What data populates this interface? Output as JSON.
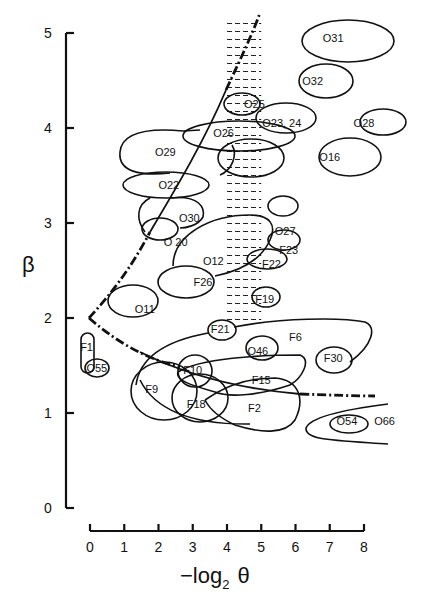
{
  "chart_data": {
    "type": "scatter",
    "title": "",
    "xlabel": "−log₂ θ",
    "ylabel": "β",
    "xlim": [
      0,
      8
    ],
    "ylim": [
      0,
      5
    ],
    "x_ticks": [
      "0",
      "1",
      "2",
      "3",
      "4",
      "5",
      "6",
      "7",
      "8"
    ],
    "y_ticks": [
      "0",
      "1",
      "2",
      "3",
      "4",
      "5"
    ],
    "grid": false,
    "legend": null,
    "annotations": "Labeled ellipse regions in (−log₂θ, β) space; dash-dot boundary curve with vertex at (0, 2); hatched band between −log₂θ ≈ 4 and 5 for β ≈ 1.95 to 5.1",
    "regions": [
      {
        "label": "O31",
        "x": 7.1,
        "y": 4.95
      },
      {
        "label": "O32",
        "x": 6.5,
        "y": 4.5
      },
      {
        "label": "O25",
        "x": 4.8,
        "y": 4.25
      },
      {
        "label": "O23, 24",
        "x": 5.6,
        "y": 4.05
      },
      {
        "label": "O28",
        "x": 8.0,
        "y": 4.05
      },
      {
        "label": "O26",
        "x": 3.9,
        "y": 3.95
      },
      {
        "label": "O29",
        "x": 2.2,
        "y": 3.75
      },
      {
        "label": "O16",
        "x": 7.0,
        "y": 3.7
      },
      {
        "label": "O22",
        "x": 2.3,
        "y": 3.4
      },
      {
        "label": "O30",
        "x": 2.9,
        "y": 3.05
      },
      {
        "label": "O27",
        "x": 5.7,
        "y": 2.92
      },
      {
        "label": "O 20",
        "x": 2.5,
        "y": 2.8
      },
      {
        "label": "F23",
        "x": 5.8,
        "y": 2.72
      },
      {
        "label": "O12",
        "x": 3.6,
        "y": 2.6
      },
      {
        "label": "F22",
        "x": 5.3,
        "y": 2.57
      },
      {
        "label": "F26",
        "x": 3.3,
        "y": 2.38
      },
      {
        "label": "O11",
        "x": 1.6,
        "y": 2.1
      },
      {
        "label": "F19",
        "x": 5.1,
        "y": 2.2
      },
      {
        "label": "F21",
        "x": 3.8,
        "y": 1.88
      },
      {
        "label": "F1",
        "x": -0.1,
        "y": 1.7
      },
      {
        "label": "O46",
        "x": 4.9,
        "y": 1.65
      },
      {
        "label": "F6",
        "x": 6.0,
        "y": 1.8
      },
      {
        "label": "F30",
        "x": 7.1,
        "y": 1.58
      },
      {
        "label": "O55",
        "x": 0.2,
        "y": 1.47
      },
      {
        "label": "F10",
        "x": 3.0,
        "y": 1.45
      },
      {
        "label": "F15",
        "x": 5.0,
        "y": 1.35
      },
      {
        "label": "F9",
        "x": 1.8,
        "y": 1.25
      },
      {
        "label": "F18",
        "x": 3.1,
        "y": 1.1
      },
      {
        "label": "F2",
        "x": 4.8,
        "y": 1.05
      },
      {
        "label": "O54",
        "x": 7.5,
        "y": 0.92
      },
      {
        "label": "O66",
        "x": 8.6,
        "y": 0.92
      }
    ],
    "boundary_curve": {
      "vertex": [
        0,
        2
      ],
      "upper_branch": [
        [
          0,
          2
        ],
        [
          1,
          2.4
        ],
        [
          2,
          2.85
        ],
        [
          3,
          3.5
        ],
        [
          4,
          4.3
        ],
        [
          5,
          5.2
        ]
      ],
      "lower_branch": [
        [
          0,
          2
        ],
        [
          1,
          1.65
        ],
        [
          2,
          1.45
        ],
        [
          3,
          1.35
        ],
        [
          5,
          1.22
        ],
        [
          8.3,
          1.15
        ]
      ]
    },
    "hatched_band": {
      "x_range": [
        4,
        5
      ],
      "y_range": [
        1.95,
        5.1
      ]
    }
  },
  "axes": {
    "x_title_prefix": "−log",
    "x_title_sub": "2",
    "x_title_symbol": "θ",
    "y_title": "β"
  }
}
